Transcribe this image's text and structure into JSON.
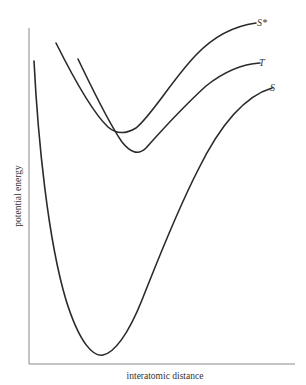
{
  "diagram": {
    "title": "",
    "xlabel": "interatomic distance",
    "ylabel": "potential energy",
    "curves": [
      {
        "id": "S",
        "label": "S",
        "description": "ground singlet state potential curve, deep minimum"
      },
      {
        "id": "S_star",
        "label": "S*",
        "description": "excited singlet state potential curve"
      },
      {
        "id": "T",
        "label": "T",
        "description": "triplet state potential curve"
      }
    ],
    "colors": {
      "curve": "#2a2a2a",
      "axis": "#8a8a8a",
      "background": "#ffffff"
    }
  }
}
